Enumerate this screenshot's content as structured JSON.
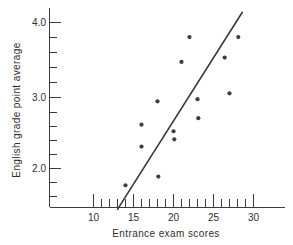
{
  "chart_data": {
    "type": "scatter",
    "title": "",
    "xlabel": "Entrance exam scores",
    "ylabel": "English grade point average",
    "xlim": [
      8.0,
      33.0
    ],
    "ylim": [
      1.4,
      4.25
    ],
    "grid": false,
    "legend": null,
    "x_ticks_major": [
      10,
      15,
      20,
      25,
      30
    ],
    "x_tick_labels": [
      "10",
      "15",
      "20",
      "25",
      "30"
    ],
    "x_ticks_minor": [
      11,
      12,
      13,
      14,
      16,
      17,
      18,
      19,
      21,
      22,
      23,
      24,
      26,
      27,
      28,
      29
    ],
    "y_ticks_major": [
      2.0,
      3.0,
      4.0
    ],
    "y_tick_labels": [
      "2.0",
      "3.0",
      "4.0"
    ],
    "y_ticks_minor": [
      1.6,
      1.8,
      2.2,
      2.4,
      2.6,
      2.8,
      3.2,
      3.4,
      3.6,
      3.8
    ],
    "points": [
      {
        "x": 14.0,
        "y": 1.77
      },
      {
        "x": 16.0,
        "y": 2.6
      },
      {
        "x": 16.0,
        "y": 2.3
      },
      {
        "x": 18.0,
        "y": 2.92
      },
      {
        "x": 18.1,
        "y": 1.89
      },
      {
        "x": 20.0,
        "y": 2.51
      },
      {
        "x": 20.1,
        "y": 2.4
      },
      {
        "x": 21.0,
        "y": 3.46
      },
      {
        "x": 22.0,
        "y": 3.8
      },
      {
        "x": 23.0,
        "y": 2.95
      },
      {
        "x": 23.1,
        "y": 2.69
      },
      {
        "x": 26.4,
        "y": 3.52
      },
      {
        "x": 27.0,
        "y": 3.03
      },
      {
        "x": 28.1,
        "y": 3.8
      }
    ],
    "regression_line": {
      "x_start": 13.0,
      "y_start": 1.44,
      "x_end": 28.6,
      "y_end": 4.14,
      "slope": 0.173,
      "intercept": -0.81
    },
    "point_color": "#3f3f3f",
    "line_color": "#3a3a3a",
    "axis_color": "#3c3c3c",
    "background_color": "#ffffff"
  }
}
